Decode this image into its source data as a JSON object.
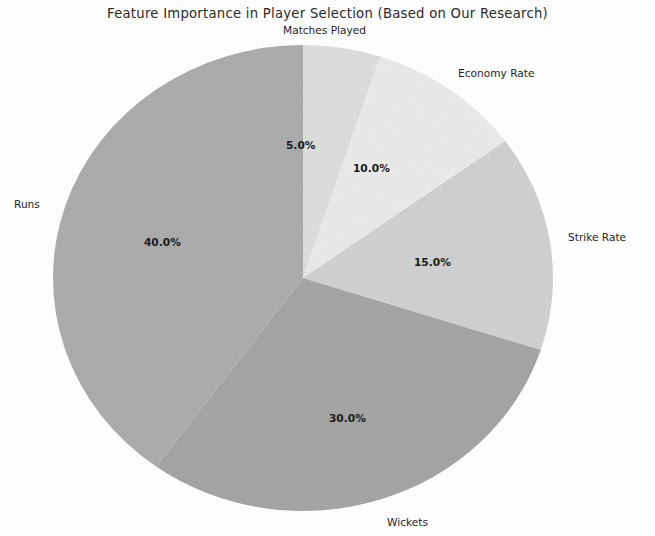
{
  "chart_data": {
    "type": "pie",
    "title": "Feature Importance in Player Selection (Based on Our Research)",
    "categories": [
      "Matches Played",
      "Economy Rate",
      "Strike Rate",
      "Wickets",
      "Runs"
    ],
    "values": [
      5.0,
      10.0,
      15.0,
      30.0,
      40.0
    ],
    "value_labels": [
      "5.0%",
      "10.0%",
      "15.0%",
      "30.0%",
      "40.0%"
    ],
    "slice_colors": [
      "#dcdcdc",
      "#e9e9e9",
      "#cfcfcf",
      "#a3a3a3",
      "#aaaaaa"
    ],
    "startangle": 90,
    "direction": "clockwise",
    "autopct": "%1.1f%%",
    "legend": "none",
    "grid": false,
    "xlabel": "",
    "ylabel": ""
  },
  "figure": {
    "title": "Feature Importance in Player Selection (Based on Our Research)",
    "background": "#ffffff"
  },
  "labels": {
    "matches_played": "Matches Played",
    "economy_rate": "Economy Rate",
    "strike_rate": "Strike Rate",
    "wickets": "Wickets",
    "runs": "Runs"
  },
  "percentages": {
    "matches_played": "5.0%",
    "economy_rate": "10.0%",
    "strike_rate": "15.0%",
    "wickets": "30.0%",
    "runs": "40.0%"
  }
}
